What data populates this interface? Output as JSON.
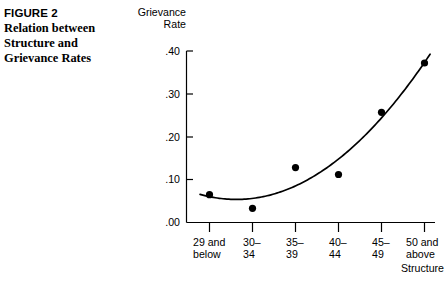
{
  "figure": {
    "label": "FIGURE 2",
    "title_lines": [
      "Relation between",
      "Structure and",
      "Grievance Rates"
    ]
  },
  "chart_data": {
    "type": "scatter",
    "title": "Relation between Structure and Grievance Rates",
    "xlabel": "Structure",
    "ylabel": "Grievance Rate",
    "ylabel_lines": [
      "Grievance",
      "Rate"
    ],
    "categories": [
      "29 and below",
      "30–34",
      "35–39",
      "40–44",
      "45–49",
      "50 and above"
    ],
    "category_lines": [
      [
        "29 and",
        "below"
      ],
      [
        "30–",
        "34"
      ],
      [
        "35–",
        "39"
      ],
      [
        "40–",
        "44"
      ],
      [
        "45–",
        "49"
      ],
      [
        "50 and",
        "above"
      ]
    ],
    "values": [
      0.065,
      0.033,
      0.128,
      0.112,
      0.257,
      0.372
    ],
    "ylim": [
      0.0,
      0.4
    ],
    "ytick_labels": [
      ".40",
      ".30",
      ".20",
      ".10",
      ".00"
    ],
    "ytick_values": [
      0.4,
      0.3,
      0.2,
      0.1,
      0.0
    ],
    "grid": false,
    "legend": "none",
    "fit_curve": {
      "label": "fitted trend curve",
      "shape": "upward curving (quadratic)",
      "描述": ""
    },
    "marker_color": "#000000",
    "line_color": "#000000",
    "axis_color": "#000000"
  }
}
